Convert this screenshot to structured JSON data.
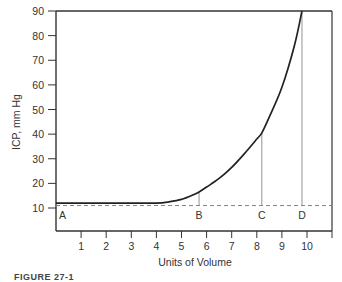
{
  "chart_data": {
    "type": "line",
    "title": "",
    "xlabel": "Units of Volume",
    "ylabel": "ICP, mm Hg",
    "xlim": [
      0,
      11
    ],
    "ylim": [
      0,
      90
    ],
    "x_ticks": [
      1,
      2,
      3,
      4,
      5,
      6,
      7,
      8,
      9,
      10
    ],
    "y_ticks": [
      10,
      20,
      30,
      40,
      50,
      60,
      70,
      80,
      90
    ],
    "grid": false,
    "series": [
      {
        "name": "Volume-pressure curve",
        "x": [
          0,
          1,
          2,
          3,
          4,
          4.5,
          5,
          5.5,
          5.7,
          6,
          6.5,
          7,
          7.5,
          8,
          8.2,
          8.5,
          9,
          9.5,
          9.8
        ],
        "y": [
          12,
          12,
          12,
          12,
          12,
          12.5,
          13.5,
          15.5,
          16.5,
          18.5,
          22,
          26.5,
          32,
          38,
          40.5,
          47,
          59,
          76,
          90
        ]
      }
    ],
    "reference_line": {
      "y": 11,
      "style": "dashed"
    },
    "annotations": [
      {
        "label": "A",
        "x": 0.1,
        "y": 11
      },
      {
        "label": "B",
        "x": 5.7,
        "y": 16.5
      },
      {
        "label": "C",
        "x": 8.2,
        "y": 40.5
      },
      {
        "label": "D",
        "x": 9.8,
        "y": 90
      }
    ]
  },
  "labels": {
    "xlabel": "Units of Volume",
    "ylabel": "ICP, mm Hg",
    "x_ticks": [
      "1",
      "2",
      "3",
      "4",
      "5",
      "6",
      "7",
      "8",
      "9",
      "10"
    ],
    "y_ticks": [
      "10",
      "20",
      "30",
      "40",
      "50",
      "60",
      "70",
      "80",
      "90"
    ],
    "points": [
      "A",
      "B",
      "C",
      "D"
    ],
    "caption": "FIGURE 27-1"
  }
}
